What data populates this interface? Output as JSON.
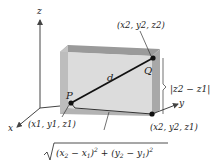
{
  "diagram": {
    "axes": {
      "x_label": "x",
      "y_label": "y",
      "z_label": "z"
    },
    "points": {
      "P": {
        "name": "P",
        "coords": "(x1, y1, z1)"
      },
      "Q": {
        "name": "Q",
        "coords": "(x2, y2, z2)"
      },
      "corner": {
        "coords": "(x2, y2, z1)"
      }
    },
    "segment_label": "d",
    "vertical_distance": "|z2 − z1|",
    "horizontal_distance": "√((x2 − x1)² + (y2 − y1)²)",
    "colors": {
      "box_front": "#d9d9d9",
      "box_top": "#9a9a9a",
      "box_side": "#a6a6a6",
      "box_inner": "#e8e8e8",
      "line": "#111111",
      "axis": "#444444"
    }
  }
}
